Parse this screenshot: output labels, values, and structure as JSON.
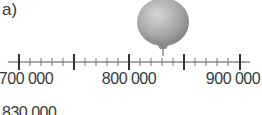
{
  "part_label": "a)",
  "number_line": {
    "min": 700000,
    "max": 900000,
    "major_step": 50000,
    "minor_step": 10000,
    "labels": [
      {
        "value": 700000,
        "text": "700 000"
      },
      {
        "value": 800000,
        "text": "800 000"
      },
      {
        "value": 900000,
        "text": "900 000"
      }
    ]
  },
  "balloon": {
    "points_to_value": 830000,
    "color": "#9a9a9a"
  },
  "cut_off_text": "830 000"
}
